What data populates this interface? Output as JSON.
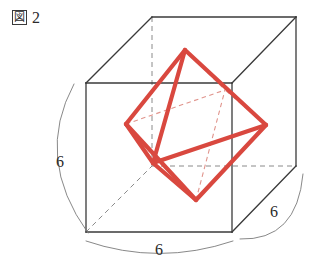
{
  "figure": {
    "caption_box_glyph": "図",
    "caption_number": "2",
    "caption_full": "図 2",
    "colors": {
      "cube_solid_edge": "#3a3a3a",
      "cube_hidden_edge": "#8a8a8a",
      "octahedron_solid_edge": "#d9483f",
      "octahedron_hidden_edge": "#e0948c",
      "dimension_arc": "#7a7a7a",
      "text": "#2b2b2b",
      "background": "#ffffff"
    },
    "stroke_widths": {
      "cube_solid_edge": 1.3,
      "cube_hidden_edge": 1.0,
      "octahedron_solid_edge": 4.2,
      "octahedron_hidden_edge": 1.1,
      "dimension_arc": 0.9
    }
  },
  "cube": {
    "edge_length": 6,
    "vertices": {
      "front_top_left": {
        "x": 86,
        "y": 83
      },
      "front_top_right": {
        "x": 232,
        "y": 83
      },
      "front_bottom_left": {
        "x": 86,
        "y": 232
      },
      "front_bottom_right": {
        "x": 232,
        "y": 232
      },
      "back_top_left": {
        "x": 152,
        "y": 17
      },
      "back_top_right": {
        "x": 296,
        "y": 17
      },
      "back_bottom_left": {
        "x": 152,
        "y": 166
      },
      "back_bottom_right": {
        "x": 296,
        "y": 166
      }
    },
    "visible_edges": [
      [
        "front_top_left",
        "front_top_right"
      ],
      [
        "front_top_right",
        "front_bottom_right"
      ],
      [
        "front_bottom_right",
        "front_bottom_left"
      ],
      [
        "front_bottom_left",
        "front_top_left"
      ],
      [
        "back_top_left",
        "back_top_right"
      ],
      [
        "back_top_right",
        "back_bottom_right"
      ],
      [
        "front_top_left",
        "back_top_left"
      ],
      [
        "front_top_right",
        "back_top_right"
      ],
      [
        "front_bottom_right",
        "back_bottom_right"
      ]
    ],
    "hidden_edges": [
      [
        "back_top_left",
        "back_bottom_left"
      ],
      [
        "back_bottom_left",
        "back_bottom_right"
      ],
      [
        "front_bottom_left",
        "back_bottom_left"
      ]
    ]
  },
  "octahedron": {
    "vertices": {
      "top": {
        "x": 185,
        "y": 50,
        "on_face": "cube_top"
      },
      "bottom": {
        "x": 196,
        "y": 200,
        "on_face": "cube_bottom"
      },
      "left": {
        "x": 126,
        "y": 124,
        "on_face": "cube_left"
      },
      "right": {
        "x": 266,
        "y": 125,
        "on_face": "cube_right"
      },
      "front": {
        "x": 153,
        "y": 163,
        "on_face": "cube_front"
      },
      "back": {
        "x": 225,
        "y": 90,
        "on_face": "cube_back"
      }
    },
    "visible_edges": [
      [
        "top",
        "left"
      ],
      [
        "top",
        "right"
      ],
      [
        "top",
        "front"
      ],
      [
        "bottom",
        "left"
      ],
      [
        "bottom",
        "right"
      ],
      [
        "bottom",
        "front"
      ],
      [
        "left",
        "front"
      ],
      [
        "right",
        "front"
      ]
    ],
    "hidden_edges": [
      [
        "top",
        "back"
      ],
      [
        "bottom",
        "back"
      ],
      [
        "left",
        "back"
      ],
      [
        "right",
        "back"
      ]
    ]
  },
  "dimensions": [
    {
      "name": "left-vertical-dimension",
      "value": "6",
      "label_x": 56,
      "label_y": 154,
      "arc": {
        "x1": 74,
        "y1": 84,
        "x2": 88,
        "y2": 232,
        "cx": 34,
        "cy": 158
      }
    },
    {
      "name": "bottom-horizontal-dimension",
      "value": "6",
      "label_x": 155,
      "label_y": 242,
      "arc": {
        "x1": 86,
        "y1": 240,
        "x2": 233,
        "y2": 240,
        "cx": 159,
        "cy": 264
      }
    },
    {
      "name": "right-depth-dimension",
      "value": "6",
      "label_x": 270,
      "label_y": 204,
      "arc": {
        "x1": 240,
        "y1": 238,
        "x2": 302,
        "y2": 174,
        "cx": 296,
        "cy": 240
      }
    }
  ]
}
